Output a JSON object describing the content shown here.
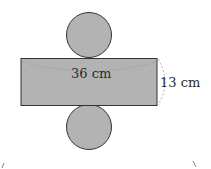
{
  "diagram": {
    "type": "cylinder-net",
    "labels": {
      "width": "36 cm",
      "height": "13 cm"
    },
    "colors": {
      "fill": "#b3b3b3",
      "stroke": "#333333",
      "dashed": "#9a9a9a",
      "background": "#ffffff"
    }
  }
}
